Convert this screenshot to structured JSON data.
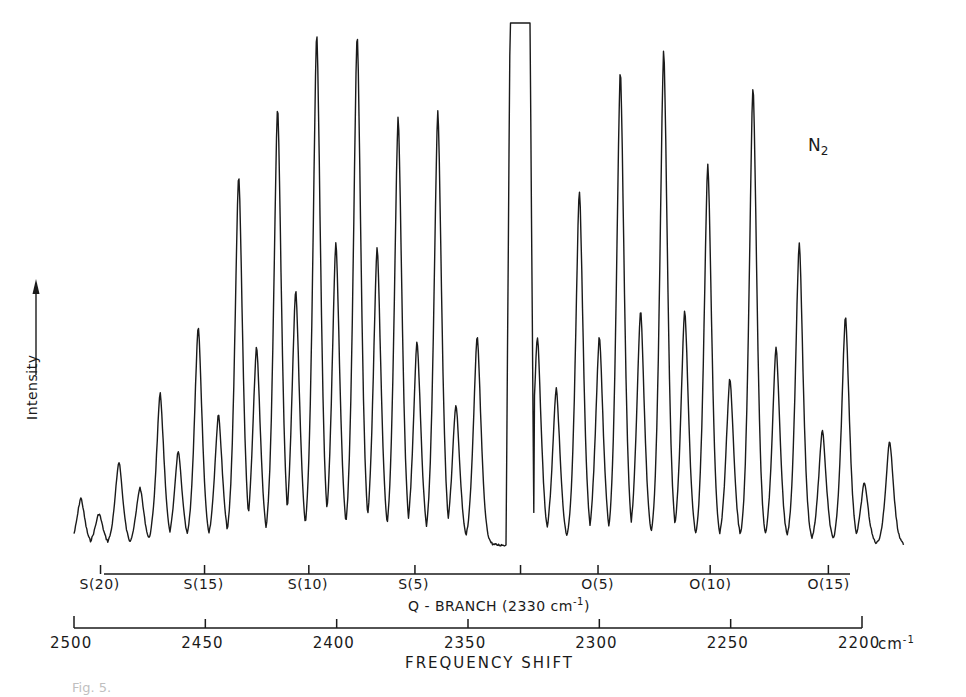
{
  "chart_data": {
    "type": "line",
    "title": "",
    "species_label": "N",
    "species_subscript": "2",
    "xlabel": "FREQUENCY SHIFT",
    "ylabel": "Intensity",
    "x_unit": "cm",
    "x_unit_sup": "-1",
    "x_axis": {
      "reversed": true,
      "xlim": [
        2500,
        2200
      ],
      "ticks": [
        2500,
        2450,
        2400,
        2350,
        2300,
        2250,
        2200
      ],
      "tick_labels": [
        "2500",
        "2450",
        "2400",
        "2350",
        "2300",
        "2250",
        "2200"
      ]
    },
    "branch_axis": {
      "q_branch_label": "Q - BRANCH (2330 cm",
      "q_branch_sup": "-1",
      "q_branch_close": ")",
      "q_branch_center": 2330,
      "ticks": [
        {
          "label": "S(20)",
          "shift": 2489.9
        },
        {
          "label": "S(15)",
          "shift": 2450.3
        },
        {
          "label": "S(10)",
          "shift": 2410.6
        },
        {
          "label": "S(5)",
          "shift": 2370.2
        },
        {
          "label": "",
          "shift": 2330.0
        },
        {
          "label": "O(5)",
          "shift": 2300.5
        },
        {
          "label": "O(10)",
          "shift": 2257.8
        },
        {
          "label": "O(15)",
          "shift": 2212.8
        }
      ]
    },
    "grid": false,
    "legend": "none",
    "q_branch_saturated": true,
    "baseline_relative_intensity": 0,
    "peaks_note": "Relative intensity 0-100 (100 = plot top); Q-branch off-scale (flat-topped box).",
    "peaks": [
      {
        "shift": 2497.4,
        "intensity": 9
      },
      {
        "shift": 2490.5,
        "intensity": 6
      },
      {
        "shift": 2482.9,
        "intensity": 16
      },
      {
        "shift": 2474.9,
        "intensity": 11
      },
      {
        "shift": 2467.2,
        "intensity": 29
      },
      {
        "shift": 2460.3,
        "intensity": 18
      },
      {
        "shift": 2452.7,
        "intensity": 42
      },
      {
        "shift": 2445.0,
        "intensity": 25
      },
      {
        "shift": 2437.3,
        "intensity": 71
      },
      {
        "shift": 2430.5,
        "intensity": 38
      },
      {
        "shift": 2422.5,
        "intensity": 84
      },
      {
        "shift": 2415.6,
        "intensity": 49
      },
      {
        "shift": 2407.6,
        "intensity": 98
      },
      {
        "shift": 2400.3,
        "intensity": 58
      },
      {
        "shift": 2392.2,
        "intensity": 98
      },
      {
        "shift": 2384.6,
        "intensity": 57
      },
      {
        "shift": 2376.6,
        "intensity": 82
      },
      {
        "shift": 2369.4,
        "intensity": 39
      },
      {
        "shift": 2361.5,
        "intensity": 83
      },
      {
        "shift": 2354.6,
        "intensity": 27
      },
      {
        "shift": 2346.5,
        "intensity": 40
      },
      {
        "shift": 2330.0,
        "intensity": 100
      },
      {
        "shift": 2323.6,
        "intensity": 40
      },
      {
        "shift": 2316.4,
        "intensity": 30
      },
      {
        "shift": 2307.6,
        "intensity": 68
      },
      {
        "shift": 2300.0,
        "intensity": 40
      },
      {
        "shift": 2292.0,
        "intensity": 91
      },
      {
        "shift": 2284.3,
        "intensity": 45
      },
      {
        "shift": 2275.5,
        "intensity": 95
      },
      {
        "shift": 2267.5,
        "intensity": 45
      },
      {
        "shift": 2258.7,
        "intensity": 73
      },
      {
        "shift": 2250.3,
        "intensity": 32
      },
      {
        "shift": 2241.5,
        "intensity": 88
      },
      {
        "shift": 2232.7,
        "intensity": 38
      },
      {
        "shift": 2223.9,
        "intensity": 58
      },
      {
        "shift": 2215.1,
        "intensity": 22
      },
      {
        "shift": 2206.3,
        "intensity": 44
      },
      {
        "shift": 2199.1,
        "intensity": 12
      },
      {
        "shift": 2189.5,
        "intensity": 20
      }
    ]
  },
  "caption_fragment": "Fig. 5."
}
